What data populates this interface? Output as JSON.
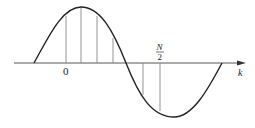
{
  "diagram": {
    "type": "sinusoid-with-samples",
    "axis_label": "k",
    "origin_label": "0",
    "half_period_label": {
      "numerator": "N",
      "denominator": "2"
    },
    "colors": {
      "curve": "#222222",
      "axis": "#444444",
      "samples": "#888888",
      "background": "#ffffff"
    }
  }
}
